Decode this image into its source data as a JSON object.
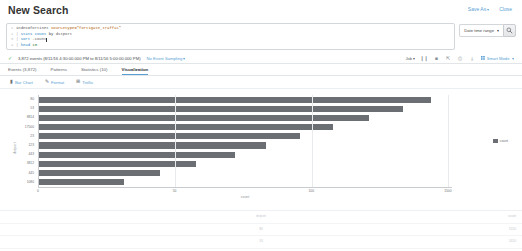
{
  "header": {
    "title": "New Search",
    "save_as_label": "Save As",
    "close_label": "Close"
  },
  "search": {
    "lines": [
      {
        "num": "1",
        "segments": [
          {
            "text": "index=fortinet ",
            "kind": "cmd"
          },
          {
            "text": "sourcetype=\"fortigate_traffic\"",
            "kind": "str"
          }
        ]
      },
      {
        "num": "2",
        "segments": [
          {
            "text": "| ",
            "kind": "pipe"
          },
          {
            "text": "stats count ",
            "kind": "fn"
          },
          {
            "text": "by ",
            "kind": "plain"
          },
          {
            "text": "dstport",
            "kind": "cmd"
          }
        ]
      },
      {
        "num": "3",
        "segments": [
          {
            "text": "| ",
            "kind": "pipe"
          },
          {
            "text": "sort ",
            "kind": "fn"
          },
          {
            "text": "-count",
            "kind": "cmd"
          }
        ]
      },
      {
        "num": "4",
        "segments": [
          {
            "text": "| ",
            "kind": "pipe"
          },
          {
            "text": "head ",
            "kind": "fn"
          },
          {
            "text": "10",
            "kind": "num"
          }
        ]
      }
    ],
    "time_range_label": "Date time range",
    "go_icon": "search-icon"
  },
  "jobbar": {
    "status_icon": "check-icon",
    "events_text": "3,872 events (8/11/16 4:30:00.000 PM to 8/11/16 5:00:00.000 PM)",
    "sampling_label": "No Event Sampling",
    "job_label": "Job",
    "icons": [
      {
        "name": "pause-icon",
        "glyph": "❙❙"
      },
      {
        "name": "stop-icon",
        "glyph": "■"
      },
      {
        "name": "share-icon",
        "glyph": "⇱"
      },
      {
        "name": "print-icon",
        "glyph": "⎙"
      },
      {
        "name": "export-icon",
        "glyph": "⤓"
      }
    ],
    "mode_icon": "grid-icon",
    "mode_label": "Smart Mode"
  },
  "tabs": [
    {
      "label": "Events (3,872)",
      "active": false
    },
    {
      "label": "Patterns",
      "active": false
    },
    {
      "label": "Statistics (10)",
      "active": false
    },
    {
      "label": "Visualization",
      "active": true
    }
  ],
  "chart_toolbar": [
    {
      "icon": "bar-chart-icon",
      "glyph": "▮",
      "label": "Bar Chart"
    },
    {
      "icon": "brush-icon",
      "glyph": "✎",
      "label": "Format"
    },
    {
      "icon": "trellis-icon",
      "glyph": "⊞",
      "label": "Trellis"
    }
  ],
  "chart_data": {
    "type": "bar",
    "orientation": "horizontal",
    "title": "",
    "xlabel": "count",
    "ylabel": "dstport",
    "categories": [
      "80",
      "53",
      "8814",
      "17500",
      "23",
      "123",
      "443",
      "3812",
      "445",
      "1080"
    ],
    "values": [
      1520,
      1410,
      1280,
      1140,
      1010,
      880,
      760,
      610,
      470,
      330
    ],
    "series": [
      {
        "name": "count",
        "values": [
          1520,
          1410,
          1280,
          1140,
          1010,
          880,
          760,
          610,
          470,
          330
        ]
      }
    ],
    "xticks": [
      "0",
      "50",
      "100",
      "1500"
    ],
    "xtick_positions_pct": [
      0,
      33,
      66,
      99
    ],
    "xlim": [
      0,
      1600
    ],
    "grid": true,
    "legend": {
      "position": "right",
      "entries": [
        "count"
      ]
    },
    "bar_color": "#6b6f74"
  },
  "bottom_pane": {
    "rows": [
      {
        "mid": "dstport",
        "right": "count"
      },
      {
        "mid": "80",
        "right": "1520"
      },
      {
        "mid": "53",
        "right": "1410"
      }
    ]
  }
}
